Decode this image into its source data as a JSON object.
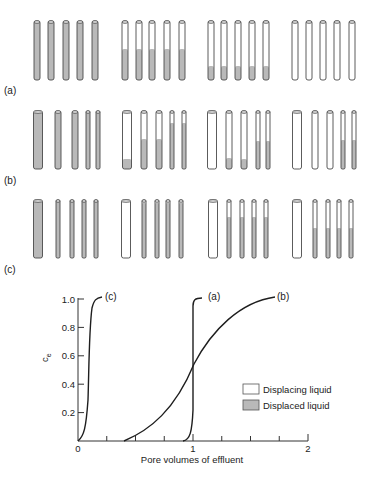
{
  "colors": {
    "displaced": "#b9b9b9",
    "displacing": "#ffffff",
    "stroke": "#4a4a4a",
    "curve": "#1e1e1e"
  },
  "rows": [
    {
      "label": "(a)",
      "label_y": 91,
      "top": 21,
      "bottom": 80,
      "groups": [
        {
          "tubes": [
            {
              "x": 37,
              "w": 6,
              "fill": 21
            },
            {
              "x": 51,
              "w": 6,
              "fill": 21
            },
            {
              "x": 66,
              "w": 6,
              "fill": 21
            },
            {
              "x": 80,
              "w": 6,
              "fill": 21
            },
            {
              "x": 95,
              "w": 6,
              "fill": 21
            }
          ]
        },
        {
          "tubes": [
            {
              "x": 125,
              "w": 6,
              "fill": 49
            },
            {
              "x": 139,
              "w": 6,
              "fill": 49
            },
            {
              "x": 152,
              "w": 6,
              "fill": 49
            },
            {
              "x": 167,
              "w": 6,
              "fill": 49
            },
            {
              "x": 182,
              "w": 6,
              "fill": 49
            }
          ]
        },
        {
          "tubes": [
            {
              "x": 211,
              "w": 6,
              "fill": 66
            },
            {
              "x": 224,
              "w": 6,
              "fill": 66
            },
            {
              "x": 238,
              "w": 6,
              "fill": 66
            },
            {
              "x": 252,
              "w": 6,
              "fill": 66
            },
            {
              "x": 266,
              "w": 6,
              "fill": 66
            }
          ]
        },
        {
          "tubes": [
            {
              "x": 295,
              "w": 6,
              "fill": 80
            },
            {
              "x": 309,
              "w": 6,
              "fill": 80
            },
            {
              "x": 323,
              "w": 6,
              "fill": 80
            },
            {
              "x": 337,
              "w": 6,
              "fill": 80
            },
            {
              "x": 352,
              "w": 6,
              "fill": 80
            }
          ]
        }
      ]
    },
    {
      "label": "(b)",
      "label_y": 181,
      "top": 111,
      "bottom": 169,
      "groups": [
        {
          "tubes": [
            {
              "x": 38,
              "w": 9,
              "fill": 111
            },
            {
              "x": 58,
              "w": 6,
              "fill": 111
            },
            {
              "x": 75,
              "w": 6,
              "fill": 111
            },
            {
              "x": 88,
              "w": 4,
              "fill": 111
            },
            {
              "x": 98,
              "w": 4,
              "fill": 111
            }
          ]
        },
        {
          "tubes": [
            {
              "x": 127,
              "w": 9,
              "fill": 159
            },
            {
              "x": 144,
              "w": 6,
              "fill": 139
            },
            {
              "x": 159,
              "w": 6,
              "fill": 139
            },
            {
              "x": 172,
              "w": 4,
              "fill": 123
            },
            {
              "x": 184,
              "w": 4,
              "fill": 123
            }
          ]
        },
        {
          "tubes": [
            {
              "x": 212,
              "w": 9,
              "fill": 169
            },
            {
              "x": 229,
              "w": 6,
              "fill": 158
            },
            {
              "x": 244,
              "w": 6,
              "fill": 159
            },
            {
              "x": 258,
              "w": 4,
              "fill": 141
            },
            {
              "x": 268,
              "w": 4,
              "fill": 141
            }
          ]
        },
        {
          "tubes": [
            {
              "x": 297,
              "w": 9,
              "fill": 169
            },
            {
              "x": 315,
              "w": 6,
              "fill": 169
            },
            {
              "x": 330,
              "w": 6,
              "fill": 169
            },
            {
              "x": 343,
              "w": 4,
              "fill": 140
            },
            {
              "x": 354,
              "w": 4,
              "fill": 140
            }
          ]
        }
      ]
    },
    {
      "label": "(c)",
      "label_y": 270,
      "top": 200,
      "bottom": 258,
      "groups": [
        {
          "tubes": [
            {
              "x": 38,
              "w": 9,
              "fill": 200
            },
            {
              "x": 58,
              "w": 4,
              "fill": 200
            },
            {
              "x": 72,
              "w": 4,
              "fill": 200
            },
            {
              "x": 84,
              "w": 4,
              "fill": 200
            },
            {
              "x": 96,
              "w": 4,
              "fill": 200
            }
          ]
        },
        {
          "tubes": [
            {
              "x": 126,
              "w": 9,
              "fill": 258
            },
            {
              "x": 144,
              "w": 4,
              "fill": 203
            },
            {
              "x": 157,
              "w": 4,
              "fill": 203
            },
            {
              "x": 168,
              "w": 4,
              "fill": 203
            },
            {
              "x": 181,
              "w": 4,
              "fill": 203
            }
          ]
        },
        {
          "tubes": [
            {
              "x": 213,
              "w": 9,
              "fill": 258
            },
            {
              "x": 229,
              "w": 4,
              "fill": 217
            },
            {
              "x": 242,
              "w": 4,
              "fill": 217
            },
            {
              "x": 254,
              "w": 4,
              "fill": 217
            },
            {
              "x": 266,
              "w": 4,
              "fill": 217
            }
          ]
        },
        {
          "tubes": [
            {
              "x": 297,
              "w": 9,
              "fill": 258
            },
            {
              "x": 315,
              "w": 4,
              "fill": 228
            },
            {
              "x": 328,
              "w": 4,
              "fill": 228
            },
            {
              "x": 339,
              "w": 4,
              "fill": 228
            },
            {
              "x": 351,
              "w": 4,
              "fill": 228
            }
          ]
        }
      ]
    }
  ],
  "chart": {
    "ylabel_main": "c",
    "ylabel_sub": "e",
    "xlabel": "Pore volumes of effluent",
    "y_ticks": [
      "0.2",
      "0.4",
      "0.6",
      "0.8",
      "1.0"
    ],
    "x_ticks": [
      "0",
      "1",
      "2"
    ],
    "curve_labels": {
      "a": "(a)",
      "b": "(b)",
      "c": "(c)"
    },
    "legend": {
      "displacing": "Displacing liquid",
      "displaced": "Displaced liquid"
    }
  },
  "chart_data": {
    "type": "line",
    "title": "",
    "xlabel": "Pore volumes of effluent",
    "ylabel": "c_e",
    "xlim": [
      0,
      2
    ],
    "ylim": [
      0,
      1.0
    ],
    "x_ticks": [
      0,
      1,
      2
    ],
    "y_ticks": [
      0.2,
      0.4,
      0.6,
      0.8,
      1.0
    ],
    "grid": false,
    "legend_position": "lower right",
    "legend": [
      "Displacing liquid",
      "Displaced liquid"
    ],
    "series": [
      {
        "name": "(c)",
        "x": [
          0,
          0.05,
          0.08,
          0.1,
          0.12,
          0.15
        ],
        "y": [
          0,
          0.2,
          0.5,
          0.8,
          0.95,
          1.0
        ]
      },
      {
        "name": "(a)",
        "x": [
          0.9,
          0.95,
          0.97,
          0.98,
          1.0,
          1.05
        ],
        "y": [
          0,
          0.1,
          0.5,
          0.95,
          1.0,
          1.0
        ]
      },
      {
        "name": "(b)",
        "x": [
          0.4,
          0.6,
          0.8,
          1.0,
          1.2,
          1.4,
          1.7
        ],
        "y": [
          0,
          0.12,
          0.3,
          0.55,
          0.78,
          0.92,
          1.0
        ]
      }
    ]
  }
}
